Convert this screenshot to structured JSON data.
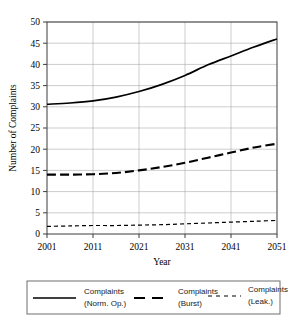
{
  "chart_data": {
    "type": "line",
    "title": "",
    "xlabel": "Year",
    "ylabel": "Number of Complaints",
    "xlim": [
      2001,
      2051
    ],
    "ylim": [
      0,
      50
    ],
    "grid": true,
    "legend_position": "below",
    "x_ticks": [
      "2001",
      "2011",
      "2021",
      "2031",
      "2041",
      "2051"
    ],
    "y_ticks": [
      "0",
      "5",
      "10",
      "15",
      "20",
      "25",
      "30",
      "35",
      "40",
      "45",
      "50"
    ],
    "x": [
      2001,
      2006,
      2011,
      2016,
      2021,
      2026,
      2031,
      2036,
      2041,
      2046,
      2051
    ],
    "series": [
      {
        "name": "Complaints (Norm. Op.)",
        "label_line1": "Complaints",
        "label_line2": "(Norm. Op.)",
        "style": "solid",
        "color": "#000000",
        "values": [
          30.6,
          30.9,
          31.4,
          32.3,
          33.6,
          35.3,
          37.4,
          39.9,
          42.0,
          44.1,
          46.0
        ]
      },
      {
        "name": "Complaints (Burst)",
        "label_line1": "Complaints",
        "label_line2": "(Burst)",
        "style": "dashed",
        "color": "#000000",
        "values": [
          14.0,
          14.0,
          14.1,
          14.4,
          15.0,
          15.8,
          16.8,
          18.0,
          19.2,
          20.4,
          21.3
        ]
      },
      {
        "name": "Complaints (Leak.)",
        "label_line1": "Complaints",
        "label_line2": "(Leak.)",
        "style": "dotted",
        "color": "#000000",
        "values": [
          1.8,
          1.9,
          2.0,
          2.0,
          2.1,
          2.2,
          2.4,
          2.6,
          2.8,
          3.0,
          3.2
        ]
      }
    ]
  },
  "axes": {
    "y_title": "Number of Complaints",
    "x_title": "Year",
    "y_tick_0": "0",
    "y_tick_1": "5",
    "y_tick_2": "10",
    "y_tick_3": "15",
    "y_tick_4": "20",
    "y_tick_5": "25",
    "y_tick_6": "30",
    "y_tick_7": "35",
    "y_tick_8": "40",
    "y_tick_9": "45",
    "y_tick_10": "50",
    "x_tick_0": "2001",
    "x_tick_1": "2011",
    "x_tick_2": "2021",
    "x_tick_3": "2031",
    "x_tick_4": "2041",
    "x_tick_5": "2051"
  },
  "legend": {
    "entries": [
      {
        "line1": "Complaints",
        "line2": "(Norm. Op.)",
        "style": "solid"
      },
      {
        "line1": "Complaints",
        "line2": "(Burst)",
        "style": "dashed"
      },
      {
        "line1": "Complaints",
        "line2": "(Leak.)",
        "style": "dotted"
      }
    ]
  }
}
